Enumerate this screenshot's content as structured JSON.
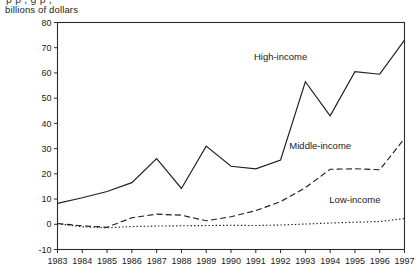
{
  "figure": {
    "clipped_title_fragment": "p   p       ,      g   p ,",
    "units_label": "billions of dollars"
  },
  "chart_data": {
    "type": "line",
    "title": "",
    "subtitle": "",
    "xlabel": "",
    "ylabel": "billions of dollars",
    "ylim": [
      -10,
      80
    ],
    "xlim": [
      1983,
      1997
    ],
    "yticks": [
      -10,
      0,
      10,
      20,
      30,
      40,
      50,
      60,
      70,
      80
    ],
    "ytick_labels": [
      "-10",
      "0",
      "10",
      "20",
      "30",
      "40",
      "50",
      "60",
      "70",
      "80"
    ],
    "grid": false,
    "legend_position": "inline-annotations",
    "categories": [
      1983,
      1984,
      1985,
      1986,
      1987,
      1988,
      1989,
      1990,
      1991,
      1992,
      1993,
      1994,
      1995,
      1996,
      1997
    ],
    "xtick_labels": [
      "1983",
      "1984",
      "1985",
      "1986",
      "1987",
      "1988",
      "1989",
      "1990",
      "1991",
      "1992",
      "1993",
      "1994",
      "1995",
      "1996",
      "1997"
    ],
    "series": [
      {
        "name": "High-income",
        "style": "solid",
        "values": [
          8.3,
          10.5,
          13.0,
          16.5,
          26.0,
          14.2,
          31.0,
          23.0,
          22.0,
          25.5,
          56.5,
          43.0,
          60.5,
          59.5,
          73.0
        ]
      },
      {
        "name": "Middle-income",
        "style": "dashed",
        "values": [
          0.3,
          -0.6,
          -1.2,
          2.6,
          4.0,
          3.6,
          1.4,
          3.0,
          5.4,
          9.0,
          14.5,
          21.8,
          22.0,
          21.6,
          34.0
        ]
      },
      {
        "name": "Low-income",
        "style": "dotted",
        "values": [
          0.2,
          -1.0,
          -1.4,
          -0.9,
          -0.7,
          -0.6,
          -0.5,
          -0.4,
          -0.5,
          -0.3,
          0.1,
          0.5,
          0.8,
          1.1,
          2.3
        ]
      }
    ],
    "annotations": [
      {
        "text": "High-income",
        "x": 1992.0,
        "y": 65.0
      },
      {
        "text": "Middle-income",
        "x": 1993.6,
        "y": 30.0
      },
      {
        "text": "Low-income",
        "x": 1995.0,
        "y": 8.5
      }
    ]
  }
}
